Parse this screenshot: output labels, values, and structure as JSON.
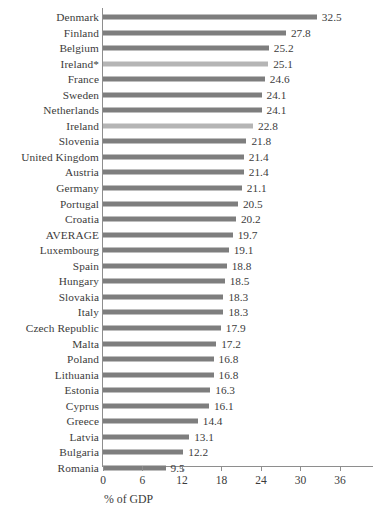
{
  "chart_data": {
    "type": "bar",
    "orientation": "horizontal",
    "title": "",
    "subtitle": "",
    "xlabel": "% of GDP",
    "ylabel": "",
    "xlim": [
      0,
      38
    ],
    "xticks": [
      0,
      6,
      12,
      18,
      24,
      30,
      36
    ],
    "xtick_labels": [
      "0",
      "6",
      "12",
      "18",
      "24",
      "30",
      "36"
    ],
    "grid": false,
    "legend": false,
    "legend_position": "none",
    "bar_color": "#7e7e7e",
    "highlight_color": "#b5b5b5",
    "axis_color": "#8e8e8e",
    "categories": [
      "Denmark",
      "Finland",
      "Belgium",
      "Ireland*",
      "France",
      "Sweden",
      "Netherlands",
      "Ireland",
      "Slovenia",
      "United Kingdom",
      "Austria",
      "Germany",
      "Portugal",
      "Croatia",
      "AVERAGE",
      "Luxembourg",
      "Spain",
      "Hungary",
      "Slovakia",
      "Italy",
      "Czech Republic",
      "Malta",
      "Poland",
      "Lithuania",
      "Estonia",
      "Cyprus",
      "Greece",
      "Latvia",
      "Bulgaria",
      "Romania"
    ],
    "values": [
      32.5,
      27.8,
      25.2,
      25.1,
      24.6,
      24.1,
      24.1,
      22.8,
      21.8,
      21.4,
      21.4,
      21.1,
      20.5,
      20.2,
      19.7,
      19.1,
      18.8,
      18.5,
      18.3,
      18.3,
      17.9,
      17.2,
      16.8,
      16.8,
      16.3,
      16.1,
      14.4,
      13.1,
      12.2,
      9.5
    ],
    "value_labels": [
      "32.5",
      "27.8",
      "25.2",
      "25.1",
      "24.6",
      "24.1",
      "24.1",
      "22.8",
      "21.8",
      "21.4",
      "21.4",
      "21.1",
      "20.5",
      "20.2",
      "19.7",
      "19.1",
      "18.8",
      "18.5",
      "18.3",
      "18.3",
      "17.9",
      "17.2",
      "16.8",
      "16.8",
      "16.3",
      "16.1",
      "14.4",
      "13.1",
      "12.2",
      "9.5"
    ],
    "highlighted": [
      false,
      false,
      false,
      true,
      false,
      false,
      false,
      true,
      false,
      false,
      false,
      false,
      false,
      false,
      false,
      false,
      false,
      false,
      false,
      false,
      false,
      false,
      false,
      false,
      false,
      false,
      false,
      false,
      false,
      false
    ]
  }
}
